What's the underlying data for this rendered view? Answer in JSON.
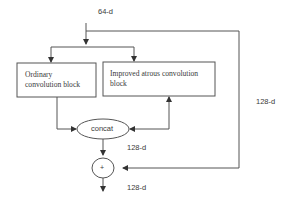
{
  "diagram": {
    "input_label": "64-d",
    "blocks": {
      "ordinary": {
        "line1": "Ordinary",
        "line2": "convolution block"
      },
      "atrous": {
        "line1": "Improved atrous convolution",
        "line2": "block"
      }
    },
    "concat_label": "concat",
    "add_symbol": "+",
    "labels": {
      "after_concat": "128-d",
      "skip": "128-d",
      "output": "128-d"
    },
    "colors": {
      "stroke": "#555555",
      "text": "#3a3a3a",
      "background": "#ffffff"
    }
  }
}
